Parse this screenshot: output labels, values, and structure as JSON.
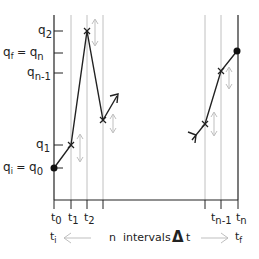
{
  "diagram": {
    "y_labels": {
      "q2": {
        "base": "q",
        "sub": "2"
      },
      "qf_eq_qn": {
        "base": "q",
        "sub": "f",
        "eq": " = ",
        "base2": "q",
        "sub2": "n"
      },
      "qn_1": {
        "base": "q",
        "sub": "n-1"
      },
      "q1": {
        "base": "q",
        "sub": "1"
      },
      "qi_eq_q0": {
        "base": "q",
        "sub": "i",
        "eq": " = ",
        "base2": "q",
        "sub2": "0"
      }
    },
    "x_labels": {
      "t0": {
        "base": "t",
        "sub": "0"
      },
      "t1": {
        "base": "t",
        "sub": "1"
      },
      "t2": {
        "base": "t",
        "sub": "2"
      },
      "tn_1": {
        "base": "t",
        "sub": "n-1"
      },
      "tn": {
        "base": "t",
        "sub": "n"
      }
    },
    "bottom": {
      "ti": {
        "base": "t",
        "sub": "i"
      },
      "middle_text": "n  intervals",
      "delta_t": "Δ",
      "t": "t",
      "tf": {
        "base": "t",
        "sub": "f"
      }
    },
    "colors": {
      "axis": "#222222",
      "path": "#222222",
      "grid": "#b0b0b0",
      "fluct_arrow": "#b8b8b8"
    }
  }
}
